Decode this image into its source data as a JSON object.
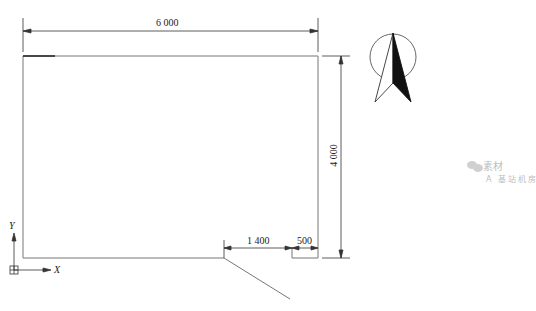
{
  "drawing": {
    "dimensions": {
      "width_label": "6 000",
      "height_label": "4 000",
      "door_offset_label": "1 400",
      "door_width_label": "500"
    },
    "axes": {
      "x_label": "X",
      "y_label": "Y"
    },
    "north_arrow": "north-arrow-symbol",
    "colors": {
      "line": "#555555",
      "text": "#222222",
      "watermark": "#bdbdbd"
    }
  },
  "watermark": {
    "brand": "素材",
    "caption": "A 基站机房"
  }
}
